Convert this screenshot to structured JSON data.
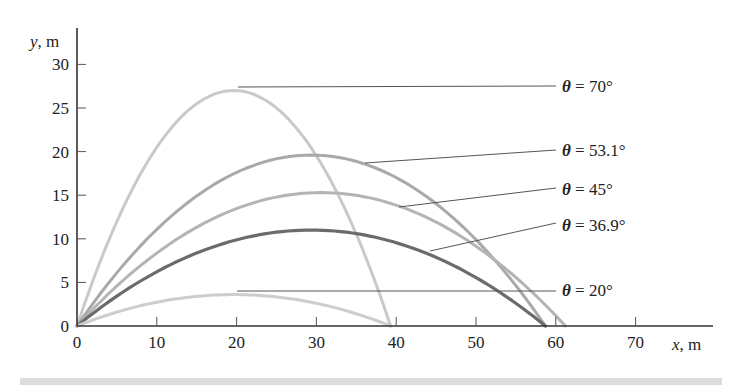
{
  "chart_data": {
    "type": "line",
    "title": "",
    "xlabel": "x, m",
    "ylabel": "y, m",
    "xlim": [
      0,
      79.5
    ],
    "ylim": [
      0,
      34
    ],
    "x_ticks": [
      0,
      10,
      20,
      30,
      40,
      50,
      60,
      70
    ],
    "y_ticks": [
      0,
      5,
      10,
      15,
      20,
      25,
      30
    ],
    "grid": false,
    "legend": "inline labels with leader lines on right",
    "initial_speed_sq": 600,
    "g": 9.81,
    "series": [
      {
        "name": "θ = 70°",
        "angle_deg": 70,
        "range_m": 39.3,
        "max_height_m": 27.0,
        "color": "#c9c9c9",
        "width": 3,
        "label_pos": [
          562,
          86
        ],
        "leader": [
          [
            238,
            87
          ],
          [
            556,
            86
          ]
        ]
      },
      {
        "name": "θ = 53.1°",
        "angle_deg": 53.1,
        "range_m": 58.7,
        "max_height_m": 19.6,
        "color": "#a9a9a9",
        "width": 3,
        "label_pos": [
          562,
          150
        ],
        "leader": [
          [
            365,
            163
          ],
          [
            556,
            150
          ]
        ]
      },
      {
        "name": "θ = 45°",
        "angle_deg": 45,
        "range_m": 61.2,
        "max_height_m": 15.3,
        "color": "#b4b4b4",
        "width": 3,
        "label_pos": [
          562,
          189
        ],
        "leader": [
          [
            399,
            207
          ],
          [
            556,
            188
          ]
        ]
      },
      {
        "name": "θ = 36.9°",
        "angle_deg": 36.9,
        "range_m": 58.7,
        "max_height_m": 11.0,
        "color": "#6b6b6b",
        "width": 3.2,
        "label_pos": [
          562,
          225
        ],
        "leader": [
          [
            430,
            251
          ],
          [
            556,
            223
          ]
        ]
      },
      {
        "name": "θ = 20°",
        "angle_deg": 20,
        "range_m": 39.3,
        "max_height_m": 3.6,
        "color": "#cdcdcd",
        "width": 3,
        "label_pos": [
          562,
          290
        ],
        "leader": [
          [
            237,
            291
          ],
          [
            556,
            291
          ]
        ]
      }
    ]
  },
  "layout": {
    "origin_px": [
      77,
      326
    ],
    "px_per_m_x": 7.98,
    "px_per_m_y": 8.72,
    "x_axis_end_px": 713,
    "y_axis_top_px": 28
  }
}
